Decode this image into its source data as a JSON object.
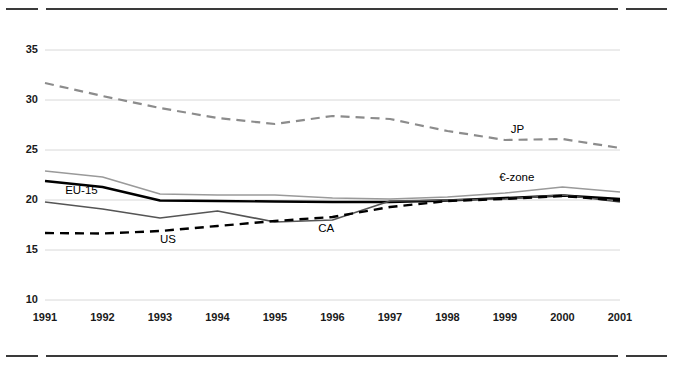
{
  "figure": {
    "top_rule_label": "top-divider",
    "bottom_rule_label": "bottom-divider"
  },
  "chart_data": {
    "type": "line",
    "title": "",
    "subtitle": "",
    "xlabel": "",
    "ylabel": "",
    "grid": "horizontal",
    "legend_position": "inline-annotations",
    "x": [
      1991,
      1992,
      1993,
      1994,
      1995,
      1996,
      1997,
      1998,
      1999,
      2000,
      2001
    ],
    "categories": [
      "1991",
      "1992",
      "1993",
      "1994",
      "1995",
      "1996",
      "1997",
      "1998",
      "1999",
      "2000",
      "2001"
    ],
    "xlim": [
      1991,
      2001
    ],
    "ylim": [
      10,
      35
    ],
    "yticks": [
      10,
      15,
      20,
      25,
      30,
      35
    ],
    "yticklabels": [
      "10",
      "15",
      "20",
      "25",
      "30",
      "35"
    ],
    "xticklabels": [
      "1991",
      "1992",
      "1993",
      "1994",
      "1995",
      "1996",
      "1997",
      "1998",
      "1999",
      "2000",
      "2001"
    ],
    "series": [
      {
        "name": "JP",
        "label": "JP",
        "style": "dashed",
        "color": "#8c8c8c",
        "width": 2.2,
        "values": [
          31.7,
          30.4,
          29.2,
          28.2,
          27.6,
          28.4,
          28.1,
          26.9,
          26.0,
          26.1,
          25.2
        ],
        "label_x": 1999.1,
        "label_y": 26.9
      },
      {
        "name": "euro-zone",
        "label": "€-zone",
        "style": "solid",
        "color": "#9a9a9a",
        "width": 1.6,
        "values": [
          22.9,
          22.3,
          20.6,
          20.5,
          20.5,
          20.2,
          20.1,
          20.3,
          20.7,
          21.3,
          20.8
        ],
        "label_x": 1998.9,
        "label_y": 22.1
      },
      {
        "name": "EU-15",
        "label": "EU-15",
        "style": "solid",
        "color": "#000000",
        "width": 2.4,
        "values": [
          21.9,
          21.3,
          19.95,
          19.9,
          19.85,
          19.8,
          19.8,
          19.95,
          20.2,
          20.45,
          20.1
        ],
        "label_x": 1991.35,
        "label_y": 20.8
      },
      {
        "name": "CA",
        "label": "CA",
        "style": "solid",
        "color": "#555555",
        "width": 1.7,
        "values": [
          19.8,
          19.1,
          18.2,
          18.9,
          17.8,
          18.0,
          19.9,
          20.0,
          20.1,
          20.5,
          19.8
        ],
        "label_x": 1995.75,
        "label_y": 17.0
      },
      {
        "name": "US",
        "label": "US",
        "style": "dashed",
        "color": "#000000",
        "width": 2.4,
        "values": [
          16.7,
          16.65,
          16.9,
          17.4,
          17.9,
          18.3,
          19.3,
          19.9,
          20.1,
          20.4,
          19.95
        ],
        "label_x": 1993.0,
        "label_y": 15.9
      }
    ]
  }
}
